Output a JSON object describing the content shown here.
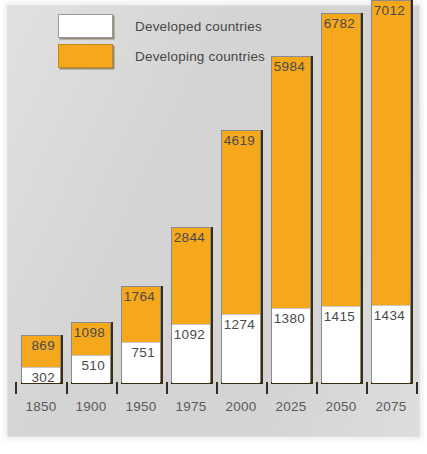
{
  "chart_data": {
    "type": "bar",
    "subtype": "stacked-bar",
    "title": "",
    "xlabel": "",
    "ylabel": "",
    "ylim": [
      0,
      7012
    ],
    "grid": false,
    "legend_position": "top-left",
    "categories": [
      "1850",
      "1900",
      "1950",
      "1975",
      "2000",
      "2025",
      "2050",
      "2075"
    ],
    "series": [
      {
        "name": "Developed countries",
        "color": "#ffffff",
        "values": [
          302,
          510,
          751,
          1092,
          1274,
          1380,
          1415,
          1434
        ]
      },
      {
        "name": "Developing countries",
        "color": "#f5a81c",
        "values": [
          567,
          588,
          1013,
          1752,
          3345,
          4604,
          5367,
          5578
        ]
      }
    ],
    "totals": [
      869,
      1098,
      1764,
      2844,
      4619,
      5984,
      6782,
      7012
    ],
    "labels_shown": {
      "top_label_is_total": true,
      "bottom_label_is_developed": true
    },
    "annotations": []
  },
  "legend": {
    "items": [
      {
        "label": "Developed countries",
        "swatch": "white"
      },
      {
        "label": "Developing countries",
        "swatch": "orange"
      }
    ]
  },
  "colors": {
    "background": "#d4d4d4",
    "developing": "#f5a81c",
    "developed": "#ffffff",
    "bar_shadow": "#3a2d10",
    "text": "#4a4a4a",
    "tick": "#2f2f2f"
  },
  "bars": [
    {
      "year": "1850",
      "total": "869",
      "developed": "302"
    },
    {
      "year": "1900",
      "total": "1098",
      "developed": "510"
    },
    {
      "year": "1950",
      "total": "1764",
      "developed": "751"
    },
    {
      "year": "1975",
      "total": "2844",
      "developed": "1092"
    },
    {
      "year": "2000",
      "total": "4619",
      "developed": "1274"
    },
    {
      "year": "2025",
      "total": "5984",
      "developed": "1380"
    },
    {
      "year": "2050",
      "total": "6782",
      "developed": "1415"
    },
    {
      "year": "2075",
      "total": "7012",
      "developed": "1434"
    }
  ]
}
